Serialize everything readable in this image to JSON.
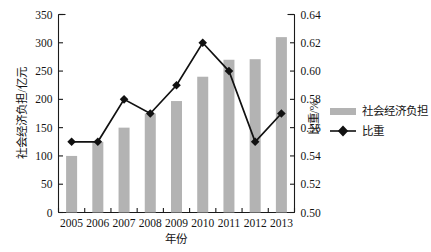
{
  "chart_data": {
    "type": "bar",
    "title": "",
    "subtitle": "",
    "xlabel": "年份",
    "ylabel": "社会经济负担/亿元",
    "y2label": "比重/%",
    "categories": [
      "2005",
      "2006",
      "2007",
      "2008",
      "2009",
      "2010",
      "2011",
      "2012",
      "2013"
    ],
    "ylim": [
      0,
      350
    ],
    "y2lim": [
      0.5,
      0.64
    ],
    "yticks": [
      "0",
      "50",
      "100",
      "150",
      "200",
      "250",
      "300",
      "350"
    ],
    "ytick_values": [
      0,
      50,
      100,
      150,
      200,
      250,
      300,
      350
    ],
    "y2ticks": [
      "0.50",
      "0.52",
      "0.54",
      "0.56",
      "0.58",
      "0.60",
      "0.62",
      "0.64"
    ],
    "y2tick_values": [
      0.5,
      0.52,
      0.54,
      0.56,
      0.58,
      0.6,
      0.62,
      0.64
    ],
    "grid": false,
    "legend_position": "right",
    "series": [
      {
        "name": "社会经济负担",
        "type": "bar",
        "axis": "left",
        "color": "#b3b3b3",
        "values": [
          100,
          125,
          150,
          175,
          197,
          240,
          270,
          271,
          310
        ]
      },
      {
        "name": "比重",
        "type": "line",
        "axis": "right",
        "color": "#111111",
        "marker": "diamond",
        "values": [
          0.55,
          0.55,
          0.58,
          0.57,
          0.59,
          0.62,
          0.6,
          0.55,
          0.57
        ]
      }
    ]
  },
  "legend": {
    "items": [
      {
        "label": "社会经济负担",
        "marker": "bar-swatch"
      },
      {
        "label": "比重",
        "marker": "line-diamond"
      }
    ]
  },
  "colors": {
    "bar": "#b3b3b3",
    "line": "#111111",
    "axis": "#1a1a1a",
    "background": "#ffffff"
  }
}
